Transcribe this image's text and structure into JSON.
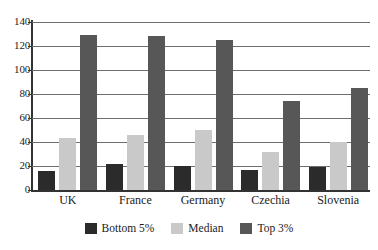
{
  "chart_data": {
    "type": "bar",
    "title": "",
    "xlabel": "",
    "ylabel": "",
    "ylim": [
      0,
      140
    ],
    "yticks": [
      0,
      20,
      40,
      60,
      80,
      100,
      120,
      140
    ],
    "grid": true,
    "legend_position": "bottom",
    "categories": [
      "UK",
      "France",
      "Germany",
      "Czechia",
      "Slovenia"
    ],
    "series": [
      {
        "name": "Bottom 5%",
        "color": "#2b2b2b",
        "values": [
          16,
          22,
          20,
          17,
          19
        ]
      },
      {
        "name": "Median",
        "color": "#c9c9c9",
        "values": [
          43,
          46,
          50,
          32,
          40
        ]
      },
      {
        "name": "Top 3%",
        "color": "#575757",
        "values": [
          129,
          128,
          125,
          74,
          85
        ]
      }
    ]
  },
  "axis": {
    "tick_labels": [
      "140",
      "120",
      "100",
      "80",
      "60",
      "40",
      "20",
      "0"
    ]
  },
  "categories": {
    "c0": "UK",
    "c1": "France",
    "c2": "Germany",
    "c3": "Czechia",
    "c4": "Slovenia"
  },
  "legend": {
    "items": [
      {
        "label": "Bottom 5%",
        "color": "#2b2b2b"
      },
      {
        "label": "Median",
        "color": "#c9c9c9"
      },
      {
        "label": "Top 3%",
        "color": "#575757"
      }
    ]
  }
}
